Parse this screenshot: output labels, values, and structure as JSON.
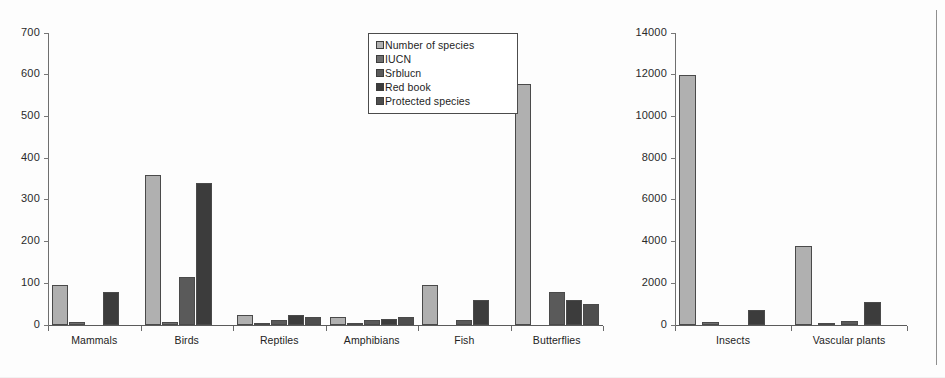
{
  "figure": {
    "kind": "grouped-bar-chart",
    "panel_count": 2,
    "background_color": "#fdfdfd"
  },
  "legend": {
    "position": "top-center-left-panel",
    "entries": [
      {
        "label": "Number of species",
        "color": "#b0b0b0"
      },
      {
        "label": "IUCN",
        "color": "#6e6e6e"
      },
      {
        "label": "Srblucn",
        "color": "#5a5a5a"
      },
      {
        "label": "Red book",
        "color": "#3c3c3c"
      },
      {
        "label": "Protected species",
        "color": "#4e4e4e"
      }
    ]
  },
  "chart_data": [
    {
      "id": "left-panel",
      "type": "bar",
      "title": "",
      "xlabel": "",
      "ylabel": "",
      "ylim": [
        0,
        700
      ],
      "yticks": [
        0,
        100,
        200,
        300,
        400,
        500,
        600,
        700
      ],
      "ytick_labels": [
        "0",
        "100",
        "200",
        "300",
        "400",
        "500",
        "600",
        "700"
      ],
      "grid": false,
      "categories": [
        "Mammals",
        "Birds",
        "Reptiles",
        "Amphibians",
        "Fish",
        "Butterflies"
      ],
      "series": [
        {
          "name": "Number of species",
          "color": "#b0b0b0",
          "values": [
            95,
            360,
            25,
            20,
            97,
            577
          ]
        },
        {
          "name": "IUCN",
          "color": "#6e6e6e",
          "values": [
            8,
            8,
            2,
            1,
            0,
            0
          ]
        },
        {
          "name": "Srblucn",
          "color": "#5a5a5a",
          "values": [
            0,
            115,
            12,
            12,
            12,
            80
          ]
        },
        {
          "name": "Red book",
          "color": "#3c3c3c",
          "values": [
            80,
            340,
            25,
            15,
            60,
            60
          ]
        },
        {
          "name": "Protected species",
          "color": "#4e4e4e",
          "values": [
            0,
            0,
            20,
            20,
            0,
            50
          ]
        }
      ]
    },
    {
      "id": "right-panel",
      "type": "bar",
      "title": "",
      "xlabel": "",
      "ylabel": "",
      "ylim": [
        0,
        14000
      ],
      "yticks": [
        0,
        2000,
        4000,
        6000,
        8000,
        10000,
        12000,
        14000
      ],
      "ytick_labels": [
        "0",
        "2000",
        "4000",
        "6000",
        "8000",
        "10000",
        "12000",
        "14000"
      ],
      "grid": false,
      "categories": [
        "Insects",
        "Vascular plants"
      ],
      "series": [
        {
          "name": "Number of species",
          "color": "#b0b0b0",
          "values": [
            12000,
            3800
          ]
        },
        {
          "name": "IUCN",
          "color": "#6e6e6e",
          "values": [
            120,
            60
          ]
        },
        {
          "name": "Srblucn",
          "color": "#5a5a5a",
          "values": [
            0,
            200
          ]
        },
        {
          "name": "Red book",
          "color": "#3c3c3c",
          "values": [
            700,
            1100
          ]
        },
        {
          "name": "Protected species",
          "color": "#4e4e4e",
          "values": [
            0,
            0
          ]
        }
      ]
    }
  ]
}
